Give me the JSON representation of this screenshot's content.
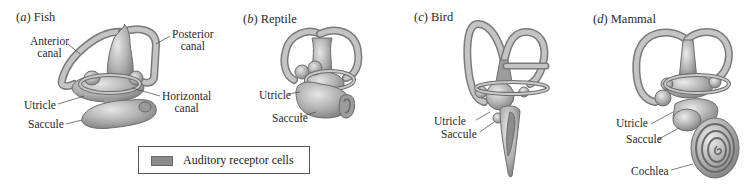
{
  "figure": {
    "panels": [
      {
        "letter": "a",
        "name": "Fish",
        "labels": {
          "anterior_canal_1": "Anterior",
          "anterior_canal_2": "canal",
          "posterior_canal_1": "Posterior",
          "posterior_canal_2": "canal",
          "horizontal_canal_1": "Horizontal",
          "horizontal_canal_2": "canal",
          "utricle": "Utricle",
          "saccule": "Saccule"
        }
      },
      {
        "letter": "b",
        "name": "Reptile",
        "labels": {
          "utricle": "Utricle",
          "saccule": "Saccule"
        }
      },
      {
        "letter": "c",
        "name": "Bird",
        "labels": {
          "utricle": "Utricle",
          "saccule": "Saccule"
        }
      },
      {
        "letter": "d",
        "name": "Mammal",
        "labels": {
          "utricle": "Utricle",
          "saccule": "Saccule",
          "cochlea": "Cochlea"
        }
      }
    ],
    "legend": {
      "swatch_color": "#8c8c8c",
      "label": "Auditory receptor cells"
    },
    "colors": {
      "tissue": "#b9b9b9",
      "tissue_dark": "#7d7d7d",
      "receptor": "#8c8c8c"
    }
  }
}
